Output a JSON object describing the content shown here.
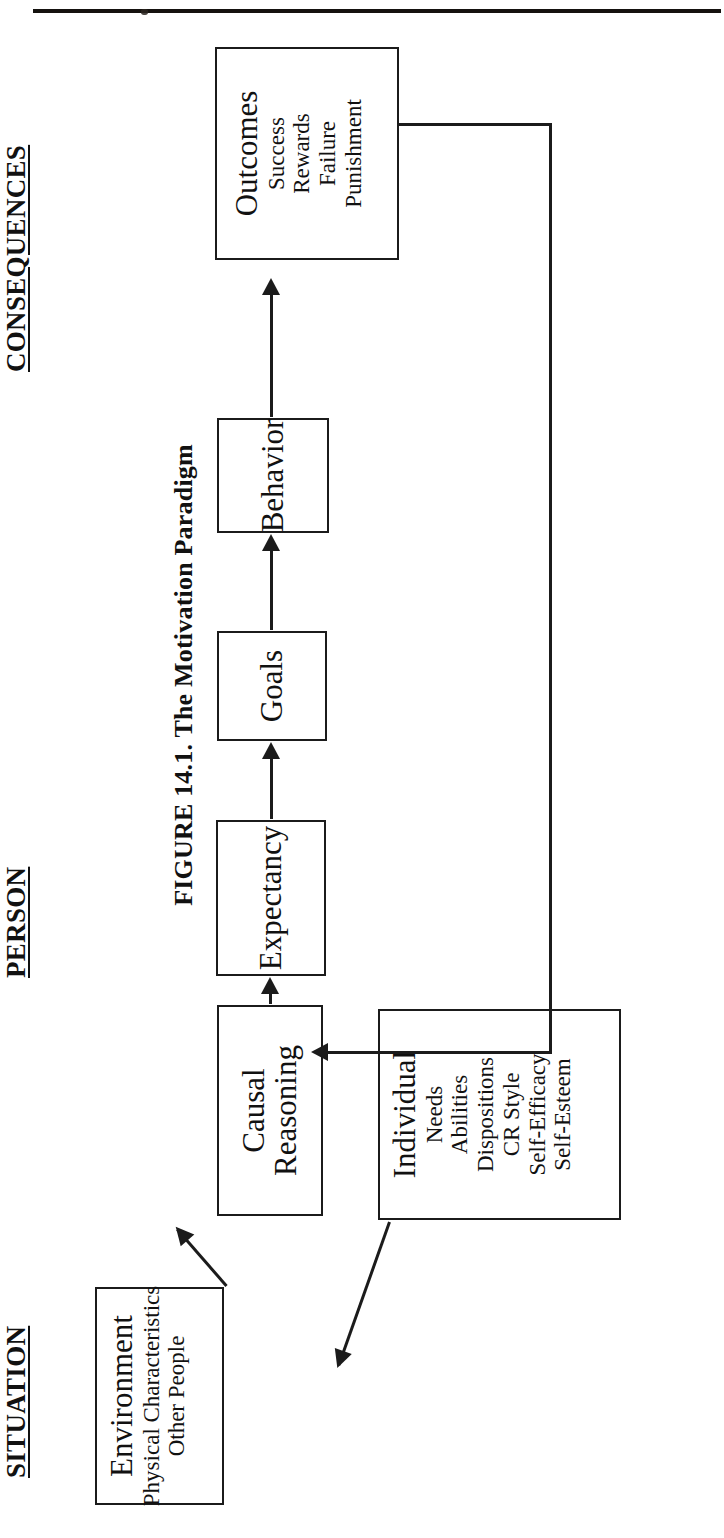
{
  "page": {
    "has_top_rule": true
  },
  "figure": {
    "caption": "FIGURE 14.1. The Motivation Paradigm",
    "sections": [
      {
        "key": "situation",
        "label": "SITUATION"
      },
      {
        "key": "person",
        "label": "PERSON"
      },
      {
        "key": "consequences",
        "label": "CONSEQUENCES"
      }
    ],
    "boxes": [
      {
        "key": "environment",
        "title": "Environment",
        "items": [
          "Physical Characteristics",
          "Other People"
        ]
      },
      {
        "key": "individual",
        "title": "Individual",
        "items": [
          "Needs",
          "Abilities",
          "Dispositions",
          "CR Style",
          "Self-Efficacy",
          "Self-Esteem"
        ]
      },
      {
        "key": "causal_reasoning",
        "title": "Causal Reasoning",
        "title_line1": "Causal",
        "title_line2": "Reasoning",
        "items": []
      },
      {
        "key": "expectancy",
        "title": "Expectancy",
        "items": []
      },
      {
        "key": "goals",
        "title": "Goals",
        "items": []
      },
      {
        "key": "behavior",
        "title": "Behavior",
        "items": []
      },
      {
        "key": "outcomes",
        "title": "Outcomes",
        "items": [
          "Success",
          "Rewards",
          "Failure",
          "Punishment"
        ]
      }
    ],
    "connections": [
      {
        "from": "environment",
        "to": "causal_reasoning",
        "style": "diagonal-arrow"
      },
      {
        "from": "individual",
        "to": "causal_reasoning",
        "style": "diagonal-arrow"
      },
      {
        "from": "causal_reasoning",
        "to": "expectancy",
        "style": "straight-arrow"
      },
      {
        "from": "expectancy",
        "to": "goals",
        "style": "straight-arrow"
      },
      {
        "from": "goals",
        "to": "behavior",
        "style": "straight-arrow"
      },
      {
        "from": "behavior",
        "to": "outcomes",
        "style": "straight-arrow"
      },
      {
        "from": "outcomes",
        "to": "causal_reasoning",
        "style": "feedback-loop"
      }
    ],
    "colors": {
      "ink": "#1b1b1b",
      "paper": "#ffffff"
    }
  }
}
